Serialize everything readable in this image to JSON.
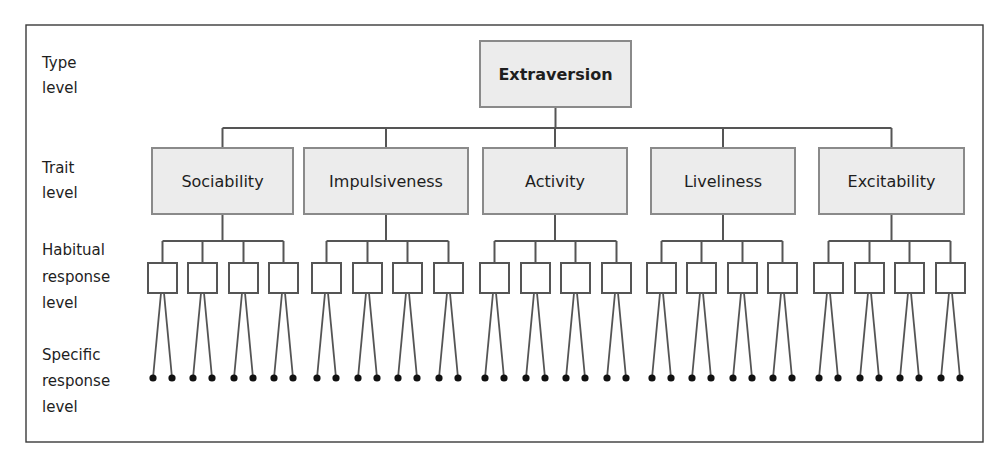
{
  "diagram": {
    "levels": [
      {
        "lines": [
          "Type",
          "level"
        ],
        "y": [
          63,
          88
        ]
      },
      {
        "lines": [
          "Trait",
          "level"
        ],
        "y": [
          168,
          193
        ]
      },
      {
        "lines": [
          "Habitual",
          "response",
          "level"
        ],
        "y": [
          250,
          277,
          303
        ]
      },
      {
        "lines": [
          "Specific",
          "response",
          "level"
        ],
        "y": [
          355,
          381,
          407
        ]
      }
    ],
    "type": {
      "label": "Extraversion",
      "x": 480,
      "y": 41,
      "w": 151,
      "h": 66
    },
    "traits": [
      {
        "label": "Sociability",
        "x": 152,
        "w": 141,
        "hab_x": [
          148,
          188,
          229,
          269
        ]
      },
      {
        "label": "Impulsiveness",
        "x": 304,
        "w": 164,
        "hab_x": [
          312,
          353,
          393,
          434
        ]
      },
      {
        "label": "Activity",
        "x": 483,
        "w": 144,
        "hab_x": [
          480,
          521,
          561,
          602
        ]
      },
      {
        "label": "Liveliness",
        "x": 651,
        "w": 144,
        "hab_x": [
          647,
          687,
          728,
          768
        ]
      },
      {
        "label": "Excitability",
        "x": 819,
        "w": 145,
        "hab_x": [
          814,
          855,
          895,
          936
        ]
      }
    ],
    "geometry": {
      "frame": {
        "x": 26,
        "y": 25,
        "w": 957,
        "h": 417
      },
      "type_bus_y": 128,
      "trait_top": 148,
      "trait_h": 66,
      "hab_bus_y": 241,
      "hab_top": 263,
      "hab_size": 29,
      "dot_y": 378,
      "dot_r": 3.6,
      "dot_offset": 10
    },
    "colors": {
      "box_fill": "#ececec",
      "box_stroke": "#8a8a8a",
      "line": "#555555",
      "dot": "#111111",
      "text": "#1e1e1e"
    }
  }
}
